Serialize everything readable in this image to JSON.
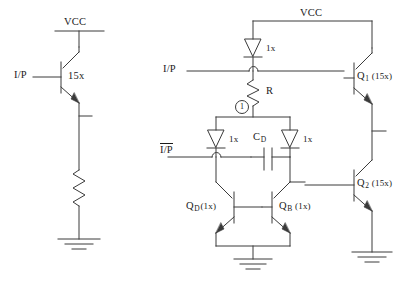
{
  "figure": {
    "type": "circuit-schematic",
    "title": ""
  },
  "left_circuit": {
    "supply_label": "VCC",
    "input_label": "I/P",
    "transistor": {
      "name": "npn-transistor",
      "size_label": "15x"
    },
    "load": {
      "name": "resistor",
      "label": ""
    },
    "ground": {
      "name": "ground-symbol",
      "label": ""
    }
  },
  "right_circuit": {
    "supply_label": "VCC",
    "input_label": "I/P",
    "complement_input_label": "I/P",
    "complement_input_overline": true,
    "node_marker": "1",
    "resistor_label": "R",
    "capacitor_label_base": "C",
    "capacitor_label_sub": "D",
    "diodes": [
      {
        "name": "diode-top-clamp",
        "size_label": "1x"
      },
      {
        "name": "diode-left-clamp",
        "size_label": "1x"
      },
      {
        "name": "diode-right-clamp",
        "size_label": "1x"
      }
    ],
    "transistors": [
      {
        "name": "transistor-q1",
        "base": "Q",
        "sub": "1",
        "size_label": "(15x)"
      },
      {
        "name": "transistor-q2",
        "base": "Q",
        "sub": "2",
        "size_label": "(15x)"
      },
      {
        "name": "transistor-qd",
        "base": "Q",
        "sub": "D",
        "size_label": "(1x)"
      },
      {
        "name": "transistor-qb",
        "base": "Q",
        "sub": "B",
        "size_label": "(1x)"
      }
    ],
    "grounds": [
      {
        "name": "ground-symbol-center",
        "label": ""
      },
      {
        "name": "ground-symbol-right",
        "label": ""
      }
    ]
  },
  "style": {
    "line_color": "#3a3a3a",
    "text_color": "#1a1a1a",
    "background": "#ffffff"
  }
}
